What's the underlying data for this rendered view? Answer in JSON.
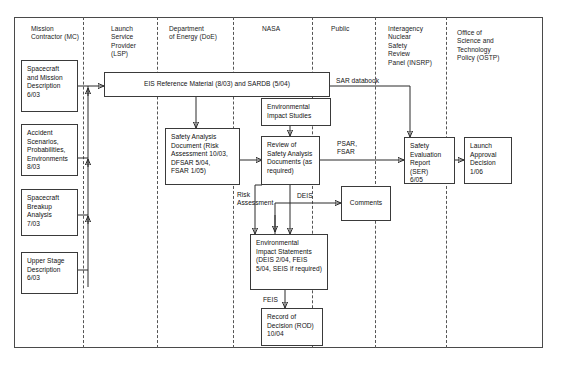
{
  "diagram": {
    "type": "swimlane-flowchart",
    "lanes": [
      {
        "id": "mc",
        "label": "Mission\nContractor (MC)"
      },
      {
        "id": "lsp",
        "label": "Launch\nService\nProvider\n(LSP)"
      },
      {
        "id": "doe",
        "label": "Department\nof Energy (DoE)"
      },
      {
        "id": "nasa",
        "label": "NASA"
      },
      {
        "id": "public",
        "label": "Public"
      },
      {
        "id": "insrp",
        "label": "Interagency\nNuclear\nSafety\nReview\nPanel (INSRP)"
      },
      {
        "id": "ostp",
        "label": "Office of\nScience and\nTechnology\nPolicy (OSTP)"
      }
    ],
    "nodes": [
      {
        "id": "spacecraft_mission",
        "lane": "mc",
        "label": "Spacecraft\nand Mission\nDescription\n6/03"
      },
      {
        "id": "accident_scenarios",
        "lane": "mc",
        "label": "Accident\nScenarios,\nProbabilities,\nEnvironments\n8/03"
      },
      {
        "id": "spacecraft_breakup",
        "lane": "mc",
        "label": "Spacecraft\nBreakup\nAnalysis\n7/03"
      },
      {
        "id": "upper_stage",
        "lane": "mc",
        "label": "Upper Stage\nDescription\n6/03"
      },
      {
        "id": "eis_reference",
        "lane": "lsp",
        "label": "EIS Reference Material (8/03) and SARDB (5/04)"
      },
      {
        "id": "safety_analysis_doc",
        "lane": "doe",
        "label": "Safety Analysis\nDocument (Risk\nAssessment 10/03,\nDFSAR 5/04,\nFSAR 1/05)"
      },
      {
        "id": "env_impact_studies",
        "lane": "nasa",
        "label": "Environmental\nImpact Studies"
      },
      {
        "id": "review_safety_docs",
        "lane": "nasa",
        "label": "Review of\nSafety Analysis\nDocuments (as\nrequired)"
      },
      {
        "id": "env_impact_stmts",
        "lane": "nasa",
        "label": "Environmental\nImpact Statements\n(DEIS 2/04, FEIS\n5/04, SEIS if required)"
      },
      {
        "id": "record_of_decision",
        "lane": "nasa",
        "label": "Record of\nDecision (ROD)\n10/04"
      },
      {
        "id": "comments",
        "lane": "public",
        "label": "Comments"
      },
      {
        "id": "safety_eval_report",
        "lane": "insrp",
        "label": "Safety\nEvaluation\nReport (SER)\n6/05"
      },
      {
        "id": "launch_approval",
        "lane": "ostp",
        "label": "Launch\nApproval\nDecision\n1/06"
      }
    ],
    "edge_labels": [
      {
        "id": "sar_databook",
        "label": "SAR databook"
      },
      {
        "id": "psar_fsar",
        "label": "PSAR,\nFSAR"
      },
      {
        "id": "risk_assessment",
        "label": "Risk\nAssessment"
      },
      {
        "id": "deis",
        "label": "DEIS"
      },
      {
        "id": "feis",
        "label": "FEIS"
      }
    ]
  },
  "colors": {
    "border": "#3a3a3a",
    "frame": "#4a4a4a",
    "divider": "#555555",
    "wire": "#2b2b2b",
    "text": "#111111",
    "background": "#ffffff"
  }
}
